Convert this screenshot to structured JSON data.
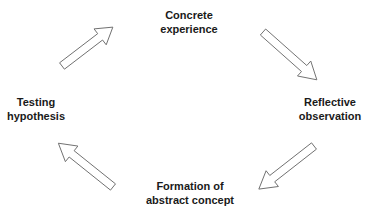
{
  "diagram": {
    "type": "cycle",
    "stages": [
      {
        "id": "concrete-experience",
        "lines": [
          "Concrete",
          "experience"
        ]
      },
      {
        "id": "reflective-observation",
        "lines": [
          "Reflective",
          "observation"
        ]
      },
      {
        "id": "abstract-concept",
        "lines": [
          "Formation of",
          "abstract concept"
        ]
      },
      {
        "id": "testing-hypothesis",
        "lines": [
          "Testing",
          "hypothesis"
        ]
      }
    ],
    "arrows": [
      {
        "from": "testing-hypothesis",
        "to": "concrete-experience",
        "direction": "up-right"
      },
      {
        "from": "concrete-experience",
        "to": "reflective-observation",
        "direction": "down-right"
      },
      {
        "from": "reflective-observation",
        "to": "abstract-concept",
        "direction": "down-left"
      },
      {
        "from": "abstract-concept",
        "to": "testing-hypothesis",
        "direction": "up-left"
      }
    ],
    "colors": {
      "arrow_stroke": "#6e6e6e",
      "arrow_fill": "#ffffff",
      "text": "#1a1a1a",
      "background": "#ffffff"
    }
  }
}
